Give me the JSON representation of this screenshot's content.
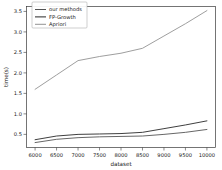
{
  "chart_data": {
    "type": "line",
    "title": "",
    "xlabel": "dataset",
    "ylabel": "time(s)",
    "xlim": [
      5800,
      10200
    ],
    "ylim": [
      0.18,
      3.62
    ],
    "grid": false,
    "legend_position": "upper left",
    "xticks": [
      6000,
      6500,
      7000,
      7500,
      8000,
      8500,
      9000,
      9500,
      10000
    ],
    "xtick_labels": [
      "6000",
      "6500",
      "7000",
      "7500",
      "8000",
      "8500",
      "9000",
      "9500",
      "10000"
    ],
    "yticks": [
      0.5,
      1.0,
      1.5,
      2.0,
      2.5,
      3.0,
      3.5
    ],
    "ytick_labels": [
      "0.5",
      "1.0",
      "1.5",
      "2.0",
      "2.5",
      "3.0",
      "3.5"
    ],
    "x": [
      6000,
      6500,
      7000,
      7500,
      8000,
      8500,
      9000,
      9500,
      10000
    ],
    "series": [
      {
        "name": "our methods",
        "color": "#4a4a4a",
        "values": [
          0.3,
          0.38,
          0.42,
          0.44,
          0.45,
          0.46,
          0.5,
          0.55,
          0.62
        ]
      },
      {
        "name": "FP-Growth",
        "color": "#1c1c1c",
        "values": [
          0.37,
          0.46,
          0.5,
          0.51,
          0.52,
          0.55,
          0.64,
          0.73,
          0.83
        ]
      },
      {
        "name": "Apriori",
        "color": "#8c8c8c",
        "values": [
          1.6,
          1.95,
          2.3,
          2.4,
          2.48,
          2.6,
          2.9,
          3.2,
          3.52
        ]
      }
    ]
  },
  "legend": {
    "entries": [
      {
        "label": "our methods"
      },
      {
        "label": "FP-Growth"
      },
      {
        "label": "Apriori"
      }
    ]
  },
  "axes": {
    "x_title": "dataset",
    "y_title": "time(s)"
  }
}
